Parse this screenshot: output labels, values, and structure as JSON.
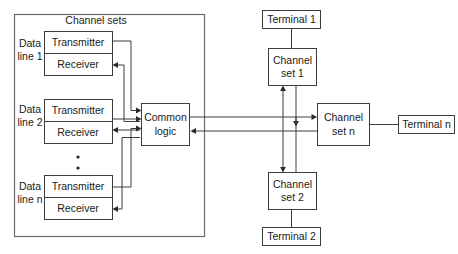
{
  "diagram": {
    "title_label": "Channel sets",
    "ellipsis_symbol": "•",
    "line_labels": [
      {
        "top": "Data",
        "bottom": "line 1"
      },
      {
        "top": "Data",
        "bottom": "line 2"
      },
      {
        "top": "Data",
        "bottom": "line n"
      }
    ],
    "channel_set_boxes": [
      {
        "transmitter": "Transmitter",
        "receiver": "Receiver"
      },
      {
        "transmitter": "Transmitter",
        "receiver": "Receiver"
      },
      {
        "transmitter": "Transmitter",
        "receiver": "Receiver"
      }
    ],
    "common_logic": {
      "line1": "Common",
      "line2": "logic"
    },
    "remote_channel_sets": [
      {
        "line1": "Channel",
        "line2": "set 1"
      },
      {
        "line1": "Channel",
        "line2": "set n"
      },
      {
        "line1": "Channel",
        "line2": "set 2"
      }
    ],
    "terminals": [
      {
        "label": "Terminal 1"
      },
      {
        "label": "Terminal n"
      },
      {
        "label": "Terminal 2"
      }
    ],
    "colors": {
      "stroke": "#3d3d3d",
      "outer_frame": "#6b6b6b",
      "text": "#1a1a1a",
      "background": "#ffffff"
    }
  }
}
